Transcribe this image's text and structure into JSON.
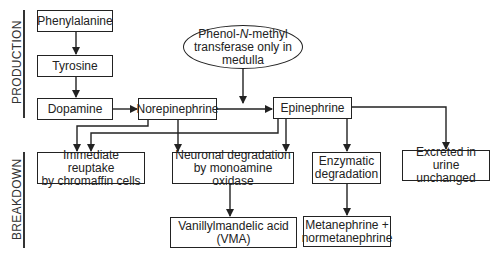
{
  "sections": {
    "production": "PRODUCTION",
    "breakdown": "BREAKDOWN"
  },
  "nodes": {
    "phenylalanine": "Phenylalanine",
    "tyrosine": "Tyrosine",
    "dopamine": "Dopamine",
    "norepinephrine": "Norepinephrine",
    "epinephrine": "Epinephrine",
    "pnmt": {
      "line1_pre": "Phenol-",
      "line1_italic": "N",
      "line1_post": "-methyl",
      "line2": "transferase only in",
      "line3": "medulla"
    },
    "reuptake": {
      "line1": "Immediate reuptake",
      "line2": "by chromaffin cells"
    },
    "neuronal": {
      "line1": "Neuronal degradation",
      "line2": "by monoamine oxidase"
    },
    "enzymatic": {
      "line1": "Enzymatic",
      "line2": "degradation"
    },
    "excreted": {
      "line1": "Excreted in urine",
      "line2": "unchanged"
    },
    "vma": {
      "line1": "Vanillylmandelic acid",
      "line2": "(VMA)"
    },
    "metanephrine": {
      "line1": "Metanephrine +",
      "line2": "normetanephrine"
    }
  },
  "edges": [
    [
      "phenylalanine",
      "tyrosine"
    ],
    [
      "tyrosine",
      "dopamine"
    ],
    [
      "dopamine",
      "norepinephrine"
    ],
    [
      "norepinephrine",
      "epinephrine"
    ],
    [
      "pnmt",
      "norepinephrine->epinephrine"
    ],
    [
      "norepinephrine",
      "reuptake"
    ],
    [
      "norepinephrine",
      "neuronal"
    ],
    [
      "epinephrine",
      "reuptake"
    ],
    [
      "epinephrine",
      "neuronal"
    ],
    [
      "epinephrine",
      "enzymatic"
    ],
    [
      "epinephrine",
      "excreted"
    ],
    [
      "neuronal",
      "vma"
    ],
    [
      "enzymatic",
      "metanephrine"
    ]
  ],
  "colors": {
    "stroke": "#222222",
    "background": "#ffffff"
  }
}
